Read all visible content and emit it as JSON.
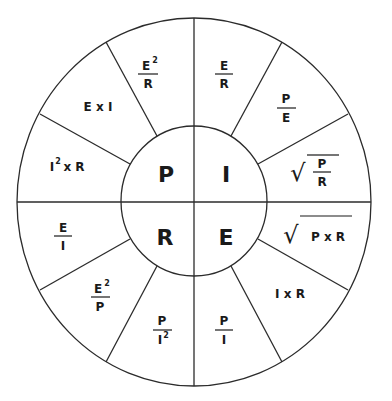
{
  "center": {
    "top_left": "P",
    "top_right": "I",
    "bottom_left": "R",
    "bottom_right": "E"
  },
  "quadrants": {
    "P": [
      {
        "id": "p1",
        "type": "fraction",
        "num": "E",
        "num_sup": "2",
        "den": "R",
        "den_sup": ""
      },
      {
        "id": "p2",
        "type": "inline",
        "text": "E x I"
      },
      {
        "id": "p3",
        "type": "inline_sup",
        "base": "I",
        "sup": "2",
        "rest": " x R"
      }
    ],
    "I": [
      {
        "id": "i1",
        "type": "fraction",
        "num": "E",
        "num_sup": "",
        "den": "R",
        "den_sup": ""
      },
      {
        "id": "i2",
        "type": "fraction",
        "num": "P",
        "num_sup": "",
        "den": "E",
        "den_sup": ""
      },
      {
        "id": "i3",
        "type": "sqrt_fraction",
        "num": "P",
        "den": "R"
      }
    ],
    "R": [
      {
        "id": "r1",
        "type": "fraction",
        "num": "E",
        "num_sup": "",
        "den": "I",
        "den_sup": ""
      },
      {
        "id": "r2",
        "type": "fraction",
        "num": "E",
        "num_sup": "2",
        "den": "P",
        "den_sup": ""
      },
      {
        "id": "r3",
        "type": "fraction",
        "num": "P",
        "num_sup": "",
        "den": "I",
        "den_sup": "2"
      }
    ],
    "E": [
      {
        "id": "e1",
        "type": "fraction",
        "num": "P",
        "num_sup": "",
        "den": "I",
        "den_sup": ""
      },
      {
        "id": "e2",
        "type": "inline",
        "text": "I x R"
      },
      {
        "id": "e3",
        "type": "sqrt_inline",
        "text": "P x R"
      }
    ]
  },
  "radical_symbol": "√",
  "colors": {
    "line": "#2b2b2b",
    "text": "#1a1a1a",
    "background": "#ffffff"
  }
}
